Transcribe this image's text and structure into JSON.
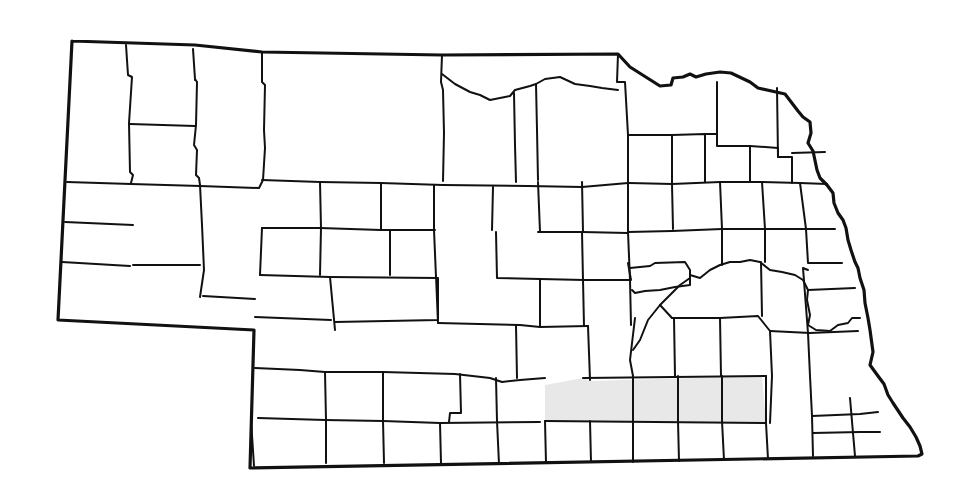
{
  "map": {
    "title": "Nebraska county outline map",
    "background_color": "#ffffff",
    "line_color": "#111111",
    "highlight_color": "#e8e8e8",
    "highlighted_region": {
      "description": "Row of six south-central counties shaded light gray",
      "polygon": "545,385 583,378 590,381 762,376 766,423 545,421"
    },
    "state_border": "72,41 195,45 262,52 442,55 618,54 630,67 660,86 671,85 673,78 683,77 690,74 696,77 706,74 720,72 731,73 750,82 758,88 785,94 798,111 803,117 810,122 811,133 808,143 813,151 817,170 820,178 827,185 833,193 834,203 838,213 843,220 846,228 848,240 851,250 855,262 858,268 860,278 864,290 865,303 868,318 870,330 873,352 870,365 878,376 884,384 888,395 893,403 903,418 910,427 916,437 920,446 922,454 918,456 250,468 254,330 58,320 72,41",
    "county_lines": [
      "126,45 128,75 132,77 129,123 130,172 133,175 131,183",
      "193,49 195,79 197,82 196,125 194,145 197,150 196,175 199,178 200,185",
      "262,52 262,82 265,85 264,130 265,148 263,180 259,188",
      "442,55 441,82 443,90 444,133 443,181",
      "618,54 617,82 625,82 628,135 628,182",
      "442,74 455,84 470,92 480,95 490,100 510,96 515,90 530,86 536,84 545,79 560,77 575,84 590,86 602,88 618,90",
      "514,93 515,145 516,182",
      "536,84 537,130 538,180",
      "195,80 195,80",
      "130,124 195,126",
      "67,182 131,184 200,186 258,188",
      "65,222 133,225",
      "62,262 130,266",
      "133,265 200,265",
      "200,185 202,225 204,270 200,297",
      "203,296 255,299",
      "262,180 320,182 381,183 443,185 528,186 582,187 628,183",
      "262,228 320,228 381,230 435,230",
      "320,182 321,228 320,275",
      "381,183 381,229",
      "434,185 434,230",
      "493,187 492,230",
      "538,182 540,232",
      "582,182 583,232",
      "628,182 628,232",
      "262,228 260,275",
      "260,275 330,277 335,330",
      "255,317 331,320",
      "330,277 438,278 438,320 335,322",
      "390,230 390,275",
      "434,230 436,277",
      "496,232 497,278 540,279 540,327",
      "538,232 582,232 628,233",
      "582,232 583,280 584,326",
      "628,232 630,280 631,325",
      "540,279 584,280 630,280",
      "436,276 438,323",
      "255,368 300,370 325,372 383,372 455,374 490,378 502,382 520,380 545,378",
      "258,418 325,420 383,421 440,423 540,422",
      "325,372 326,420",
      "383,372 383,420",
      "460,374 461,413 450,413 449,422",
      "496,378 497,421",
      "438,323 520,325 540,327 588,326",
      "516,325 517,378",
      "588,326 590,380",
      "251,420 254,466",
      "326,420 326,463",
      "383,421 384,463",
      "440,423 441,463",
      "497,421 499,464",
      "545,421 546,463",
      "590,421 591,462",
      "633,421 633,462",
      "678,421 679,461",
      "722,421 724,460",
      "766,423 768,459",
      "545,421 766,423",
      "583,378 766,376",
      "633,376 633,421",
      "678,376 678,421",
      "722,376 722,421",
      "766,376 766,423",
      "770,331 772,376 770,423",
      "808,333 810,376 812,416 813,456",
      "770,331 810,333 858,331",
      "812,416 860,414 878,412",
      "813,433 860,432 880,432",
      "850,398 853,433 855,456",
      "808,333 803,268 808,270",
      "629,183 672,184 720,182 762,182 800,183",
      "628,135 672,135 672,184",
      "672,135 705,134 705,182",
      "705,134 717,134 717,146 750,146 750,182",
      "717,134 717,82",
      "750,146 778,148 778,157 792,157 792,183",
      "777,88 778,157",
      "792,153 825,152",
      "800,183 827,184",
      "672,184 673,229",
      "720,182 722,229",
      "762,182 765,229",
      "800,183 806,229 835,229",
      "628,232 672,231 722,229 765,229 806,229",
      "630,268 650,266 655,263 685,262 690,270 690,285 675,287 660,290 645,291 635,293 632,290",
      "628,263 631,280",
      "690,275 700,278 710,270 720,265 730,262 740,262 750,260 760,262 770,270 782,272 795,275 803,280 808,290 807,300 810,315 808,325 816,330 830,331 838,325 848,323 852,318 860,318",
      "690,278 680,285 670,295 660,305 648,320 640,340 633,350",
      "722,229 722,265",
      "765,229 765,262",
      "806,229 808,263 842,263",
      "808,290 855,288",
      "635,318 630,360 633,376",
      "674,318 675,376",
      "720,318 721,376",
      "660,305 672,318 720,318 758,316 770,331",
      "672,318 674,318",
      "761,262 762,316"
    ]
  }
}
